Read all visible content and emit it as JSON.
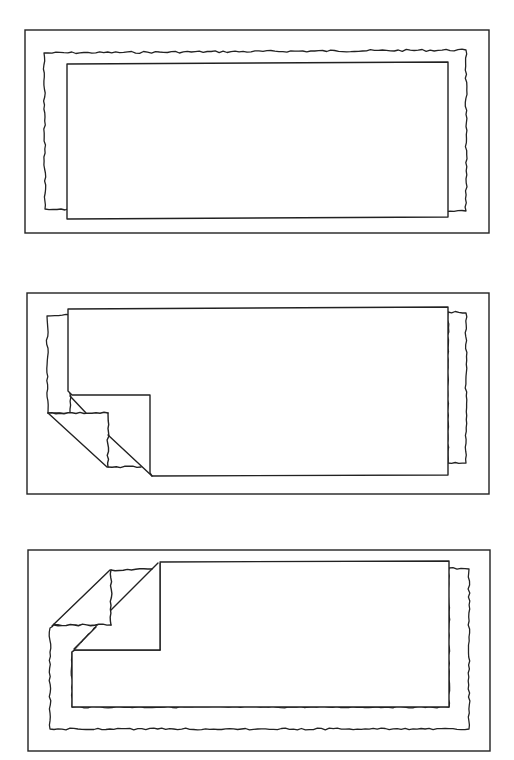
{
  "figure": {
    "width": 514,
    "height": 760,
    "stroke_color": "#222222",
    "background": "#ffffff",
    "panels": [
      {
        "id": "panel-1",
        "label": "flat page over torn sheet",
        "frame": [
          25,
          30,
          489,
          233
        ],
        "torn_sheet": {
          "points": [
            [
              44,
              53
            ],
            [
              466,
              50
            ],
            [
              466,
              211
            ],
            [
              448,
              211
            ],
            [
              448,
              217
            ],
            [
              67,
              218
            ],
            [
              67,
              210
            ],
            [
              45,
              209
            ]
          ]
        },
        "page": {
          "points": [
            [
              67,
              64
            ],
            [
              448,
              62
            ],
            [
              448,
              217
            ],
            [
              67,
              219
            ]
          ]
        },
        "fold": null
      },
      {
        "id": "panel-2",
        "label": "page with bottom-left corner folded",
        "frame": [
          27,
          293,
          489,
          494
        ],
        "torn_sheet": {
          "points": [
            [
              47,
              316
            ],
            [
              68,
              315
            ],
            [
              68,
              395
            ],
            [
              70,
              399
            ],
            [
              86,
              413
            ],
            [
              48,
              413
            ]
          ]
        },
        "torn_sheet_right": {
          "points": [
            [
              448,
              312
            ],
            [
              466,
              313
            ],
            [
              466,
              463
            ],
            [
              448,
              463
            ]
          ]
        },
        "page": {
          "points": [
            [
              68,
              309
            ],
            [
              448,
              307
            ],
            [
              448,
              475
            ],
            [
              152,
              476
            ],
            [
              150,
              473
            ],
            [
              150,
              395
            ],
            [
              72,
              395
            ],
            [
              68,
              391
            ]
          ]
        },
        "fold": {
          "back_flap": [
            [
              48,
              413
            ],
            [
              108,
              413
            ],
            [
              108,
              467
            ],
            [
              140,
              467
            ],
            [
              107,
              467
            ]
          ],
          "flap_outer_diag": [
            [
              48,
              413
            ],
            [
              107,
              467
            ]
          ],
          "page_corner_diag": [
            [
              70,
              396
            ],
            [
              86,
              413
            ]
          ],
          "flap_inner_diag": [
            [
              108,
              435
            ],
            [
              152,
              476
            ]
          ],
          "flap_triangle": [
            [
              108,
              413
            ],
            [
              150,
              413
            ],
            [
              150,
              473
            ],
            [
              152,
              476
            ],
            [
              140,
              467
            ],
            [
              108,
              467
            ]
          ]
        }
      },
      {
        "id": "panel-3",
        "label": "page with top-left corner folded",
        "frame": [
          28,
          550,
          490,
          751
        ],
        "torn_sheet": {
          "points": [
            [
              50,
              628
            ],
            [
              54,
              624
            ],
            [
              111,
              625
            ],
            [
              111,
              612
            ],
            [
              72,
              652
            ],
            [
              72,
              707
            ],
            [
              449,
              707
            ],
            [
              449,
              568
            ],
            [
              469,
              569
            ],
            [
              469,
              729
            ],
            [
              50,
              729
            ]
          ]
        },
        "page": {
          "points": [
            [
              160,
              562
            ],
            [
              449,
              561
            ],
            [
              449,
              707
            ],
            [
              72,
              707
            ],
            [
              72,
              652
            ],
            [
              75,
              650
            ],
            [
              160,
              650
            ]
          ]
        },
        "fold": {
          "back_flap_top": [
            [
              111,
              570
            ],
            [
              152,
              569
            ]
          ],
          "back_flap_vertical": [
            [
              111,
              570
            ],
            [
              111,
              625
            ]
          ],
          "back_flap_bottom": [
            [
              54,
              625
            ],
            [
              111,
              625
            ]
          ],
          "flap_outer_diag": [
            [
              52,
              626
            ],
            [
              110,
              570
            ]
          ],
          "page_diag_lower": [
            [
              74,
              649
            ],
            [
              96,
              627
            ]
          ],
          "page_diag_upper": [
            [
              111,
              610
            ],
            [
              158,
              563
            ]
          ],
          "page_inner_vertical": [
            [
              160,
              563
            ],
            [
              160,
              650
            ]
          ],
          "page_inner_horizontal": [
            [
              75,
              650
            ],
            [
              160,
              650
            ]
          ]
        }
      }
    ]
  }
}
